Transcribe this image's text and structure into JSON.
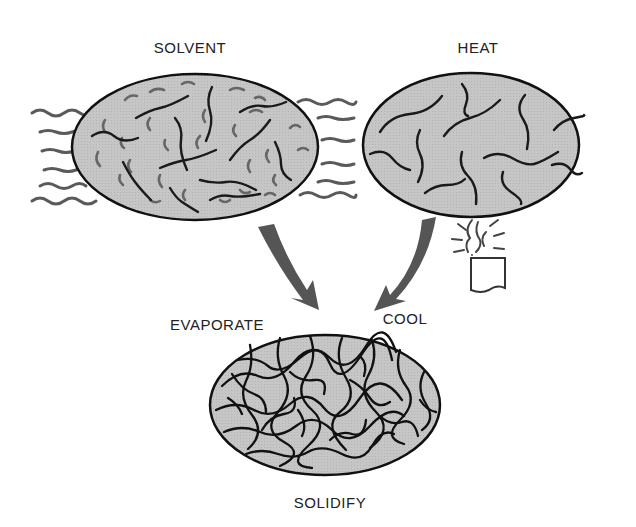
{
  "diagram": {
    "title": "",
    "colors": {
      "fill": "#c4c4c4",
      "outline": "#111111",
      "chain": "#1a1a1a",
      "solvent_chain": "#555555",
      "arrow": "#555555",
      "wave": "#555555",
      "text": "#222222"
    },
    "nodes": [
      {
        "id": "solvent",
        "label": "SOLVENT",
        "x": 190,
        "y": 40
      },
      {
        "id": "heat",
        "label": "HEAT",
        "x": 478,
        "y": 40
      },
      {
        "id": "solidify",
        "label": "SOLIDIFY",
        "x": 330,
        "y": 494
      }
    ],
    "edges": [
      {
        "from": "solvent",
        "to": "solidify",
        "label": "EVAPORATE",
        "x": 217,
        "y": 316
      },
      {
        "from": "heat",
        "to": "solidify",
        "label": "COOL",
        "x": 405,
        "y": 310
      }
    ]
  }
}
